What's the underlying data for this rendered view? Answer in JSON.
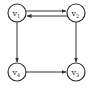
{
  "diagram": {
    "type": "directed-graph",
    "nodes": [
      {
        "id": "v1",
        "label": "v",
        "sub": "1",
        "x": 17,
        "y": 13
      },
      {
        "id": "v2",
        "label": "v",
        "sub": "2",
        "x": 76,
        "y": 13
      },
      {
        "id": "v4",
        "label": "v",
        "sub": "4",
        "x": 17,
        "y": 72
      },
      {
        "id": "v3",
        "label": "v",
        "sub": "3",
        "x": 76,
        "y": 72
      }
    ],
    "edges": [
      {
        "from": "v1",
        "to": "v2"
      },
      {
        "from": "v2",
        "to": "v1"
      },
      {
        "from": "v1",
        "to": "v4"
      },
      {
        "from": "v2",
        "to": "v3"
      },
      {
        "from": "v4",
        "to": "v3"
      }
    ],
    "colors": {
      "stroke": "#333333",
      "background": "#ffffff"
    }
  }
}
